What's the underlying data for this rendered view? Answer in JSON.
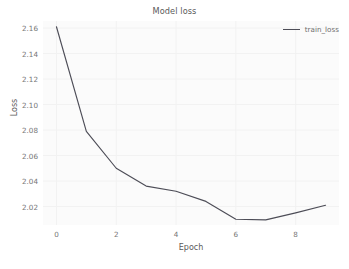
{
  "chart_data": {
    "type": "line",
    "title": "Model loss",
    "xlabel": "Epoch",
    "ylabel": "Loss",
    "x": [
      0,
      1,
      2,
      3,
      4,
      5,
      6,
      7,
      8,
      9
    ],
    "series": [
      {
        "name": "train_loss",
        "color": "#4d4d57",
        "values": [
          2.161,
          2.079,
          2.05,
          2.036,
          2.032,
          2.024,
          2.01,
          2.0095,
          2.015,
          2.021
        ]
      }
    ],
    "xlim": [
      -0.45,
      9.45
    ],
    "ylim": [
      2.0055,
      2.1655
    ],
    "xticks": [
      0,
      2,
      4,
      6,
      8
    ],
    "xtick_labels": [
      "0",
      "2",
      "4",
      "6",
      "8"
    ],
    "yticks": [
      2.02,
      2.04,
      2.06,
      2.08,
      2.1,
      2.12,
      2.14,
      2.16
    ],
    "ytick_labels": [
      "2.02",
      "2.04",
      "2.06",
      "2.08",
      "2.10",
      "2.12",
      "2.14",
      "2.16"
    ],
    "grid": true,
    "grid_color": "#f2f2f2",
    "plot_background": "#fbfbfb",
    "figure_background": "#ffffff",
    "legend": {
      "position": "upper right",
      "entries": [
        {
          "label": "train_loss",
          "color": "#4d4d57",
          "marker": "line"
        }
      ]
    }
  }
}
